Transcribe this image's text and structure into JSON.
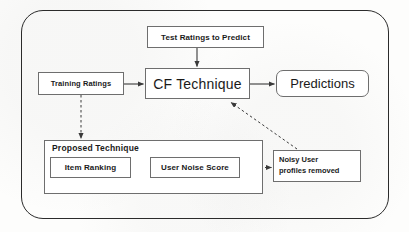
{
  "diagram": {
    "nodes": {
      "test_ratings": {
        "label": "Test Ratings to Predict",
        "shape": "rectangle"
      },
      "training_ratings": {
        "label": "Training Ratings",
        "shape": "rectangle"
      },
      "cf_technique": {
        "label": "CF Technique",
        "shape": "rectangle"
      },
      "predictions": {
        "label": "Predictions",
        "shape": "rounded-rectangle"
      },
      "proposed_technique": {
        "label": "Proposed  Technique",
        "shape": "group-rectangle"
      },
      "item_ranking": {
        "label": "Item  Ranking",
        "shape": "rectangle"
      },
      "user_noise_score": {
        "label": "User Noise Score",
        "shape": "rectangle"
      },
      "noisy_user_profiles": {
        "line1": "Noisy User",
        "line2": "profiles removed",
        "shape": "rectangle"
      }
    },
    "edges": [
      {
        "from": "test_ratings",
        "to": "cf_technique",
        "style": "solid",
        "direction": "down"
      },
      {
        "from": "training_ratings",
        "to": "cf_technique",
        "style": "solid",
        "direction": "right"
      },
      {
        "from": "cf_technique",
        "to": "predictions",
        "style": "solid",
        "direction": "right"
      },
      {
        "from": "training_ratings",
        "to": "proposed_technique",
        "style": "dashed",
        "direction": "down"
      },
      {
        "from": "item_ranking",
        "to": "user_noise_score",
        "style": "dashed",
        "direction": "right"
      },
      {
        "from": "user_noise_score",
        "to": "noisy_user_profiles",
        "style": "dashed",
        "direction": "right"
      },
      {
        "from": "noisy_user_profiles",
        "to": "cf_technique",
        "style": "dashed",
        "direction": "up-left"
      }
    ],
    "colors": {
      "outer_border": "#2b2b2b",
      "box_border": "#6e6e6e",
      "text": "#1a1a1a",
      "background": "#fdfdfc",
      "arrow": "#3a3a3a"
    }
  }
}
